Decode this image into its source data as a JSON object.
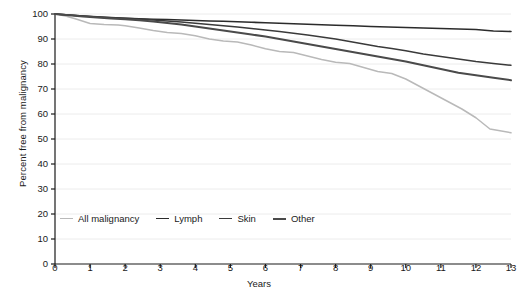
{
  "chart_data": {
    "type": "line",
    "title": "",
    "subtitle": "",
    "xlabel": "Years",
    "ylabel": "Percent free from malignancy",
    "xlim": [
      0,
      13
    ],
    "ylim": [
      0,
      100
    ],
    "xticks": [
      "0",
      "1",
      "2",
      "3",
      "4",
      "5",
      "6",
      "7",
      "8",
      "9",
      "10",
      "11",
      "12",
      "13"
    ],
    "yticks": [
      "0",
      "10",
      "20",
      "30",
      "40",
      "50",
      "60",
      "70",
      "80",
      "90",
      "100"
    ],
    "grid": "horizontal",
    "legend_position": "inside-bottom-left",
    "series": [
      {
        "name": "All malignancy",
        "color": "#b9b9b9",
        "width": 1.5,
        "x": [
          0,
          0.3,
          0.6,
          1.0,
          1.4,
          1.8,
          2.0,
          2.4,
          2.8,
          3.2,
          3.6,
          4.0,
          4.4,
          4.8,
          5.2,
          5.6,
          6.0,
          6.4,
          6.8,
          7.2,
          7.6,
          8.0,
          8.4,
          8.8,
          9.2,
          9.6,
          10.0,
          10.4,
          10.8,
          11.2,
          11.6,
          12.0,
          12.4,
          13.0
        ],
        "y": [
          100,
          99.2,
          98.0,
          96.2,
          95.8,
          95.6,
          95.3,
          94.4,
          93.4,
          92.6,
          92.2,
          91.3,
          90.0,
          89.2,
          88.8,
          87.6,
          86.1,
          85.0,
          84.6,
          83.2,
          81.8,
          80.7,
          80.2,
          78.6,
          77.0,
          76.2,
          74.0,
          71.0,
          68.0,
          65.0,
          62.0,
          58.5,
          54.0,
          52.5
        ]
      },
      {
        "name": "Lymph",
        "color": "#2b2b2b",
        "width": 1.6,
        "x": [
          0,
          0.4,
          0.8,
          1.2,
          1.6,
          2.0,
          2.4,
          2.8,
          3.2,
          3.6,
          4.0,
          4.4,
          4.8,
          5.2,
          5.6,
          6.0,
          6.4,
          6.8,
          7.2,
          7.6,
          8.0,
          8.5,
          9.0,
          9.5,
          10.0,
          10.5,
          11.0,
          11.5,
          12.0,
          12.5,
          13.0
        ],
        "y": [
          100,
          99.6,
          99.2,
          98.8,
          98.5,
          98.3,
          98.1,
          97.9,
          97.8,
          97.6,
          97.4,
          97.2,
          97.1,
          96.9,
          96.7,
          96.5,
          96.3,
          96.1,
          95.9,
          95.7,
          95.5,
          95.3,
          95.0,
          94.8,
          94.6,
          94.4,
          94.2,
          94.0,
          93.8,
          93.2,
          93.0
        ]
      },
      {
        "name": "Skin",
        "color": "#3a3a3a",
        "width": 1.5,
        "x": [
          0,
          0.4,
          0.8,
          1.2,
          1.6,
          2.0,
          2.4,
          2.8,
          3.2,
          3.6,
          4.0,
          4.4,
          4.8,
          5.2,
          5.6,
          6.0,
          6.4,
          6.8,
          7.2,
          7.6,
          8.0,
          8.4,
          8.8,
          9.2,
          9.6,
          10.0,
          10.5,
          11.0,
          11.5,
          12.0,
          12.5,
          13.0
        ],
        "y": [
          100,
          99.6,
          99.2,
          98.9,
          98.6,
          98.3,
          98.0,
          97.6,
          97.2,
          96.8,
          96.3,
          95.8,
          95.3,
          94.8,
          94.2,
          93.6,
          93.0,
          92.3,
          91.6,
          90.8,
          90.0,
          89.0,
          88.0,
          87.0,
          86.2,
          85.3,
          84.0,
          83.0,
          82.0,
          81.0,
          80.2,
          79.5
        ]
      },
      {
        "name": "Other",
        "color": "#4a4a4a",
        "width": 2.0,
        "x": [
          0,
          0.4,
          0.8,
          1.2,
          1.6,
          2.0,
          2.4,
          2.8,
          3.2,
          3.6,
          4.0,
          4.4,
          4.8,
          5.2,
          5.6,
          6.0,
          6.4,
          6.8,
          7.2,
          7.6,
          8.0,
          8.4,
          8.8,
          9.2,
          9.6,
          10.0,
          10.5,
          11.0,
          11.5,
          12.0,
          12.5,
          13.0
        ],
        "y": [
          100,
          99.5,
          99.0,
          98.6,
          98.2,
          97.9,
          97.5,
          97.0,
          96.4,
          95.8,
          95.0,
          94.2,
          93.4,
          92.6,
          91.8,
          91.0,
          90.0,
          89.0,
          88.0,
          87.0,
          86.0,
          85.0,
          84.0,
          83.0,
          82.0,
          81.0,
          79.5,
          78.0,
          76.5,
          75.5,
          74.5,
          73.5
        ]
      }
    ]
  },
  "axis_color": "#1a1a1a",
  "grid_color": "#ececec"
}
